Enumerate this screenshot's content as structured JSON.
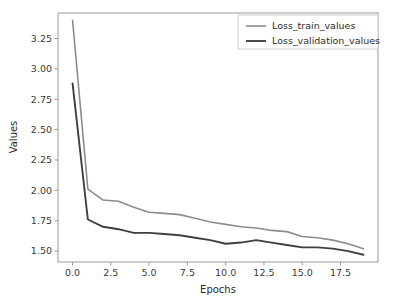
{
  "chart_data": {
    "type": "line",
    "title": "",
    "xlabel": "Epochs",
    "ylabel": "Values",
    "xlim": [
      -0.95,
      19.95
    ],
    "ylim": [
      1.41,
      3.46
    ],
    "grid": false,
    "legend_position": "upper right",
    "xticks": [
      0.0,
      2.5,
      5.0,
      7.5,
      10.0,
      12.5,
      15.0,
      17.5
    ],
    "xtick_labels": [
      "0.0",
      "2.5",
      "5.0",
      "7.5",
      "10.0",
      "12.5",
      "15.0",
      "17.5"
    ],
    "yticks": [
      1.5,
      1.75,
      2.0,
      2.25,
      2.5,
      2.75,
      3.0,
      3.25
    ],
    "ytick_labels": [
      "1.50",
      "1.75",
      "2.00",
      "2.25",
      "2.50",
      "2.75",
      "3.00",
      "3.25"
    ],
    "x": [
      0,
      1,
      2,
      3,
      4,
      5,
      6,
      7,
      8,
      9,
      10,
      11,
      12,
      13,
      14,
      15,
      16,
      17,
      18,
      19
    ],
    "series": [
      {
        "name": "Loss_train_values",
        "color": "#8c8c8c",
        "width": 1.6,
        "values": [
          3.4,
          2.01,
          1.92,
          1.91,
          1.86,
          1.82,
          1.81,
          1.8,
          1.77,
          1.74,
          1.72,
          1.7,
          1.69,
          1.67,
          1.66,
          1.62,
          1.61,
          1.59,
          1.56,
          1.52
        ]
      },
      {
        "name": "Loss_validation_values",
        "color": "#3f3f3f",
        "width": 1.9,
        "values": [
          2.88,
          1.76,
          1.7,
          1.68,
          1.65,
          1.65,
          1.64,
          1.63,
          1.61,
          1.59,
          1.56,
          1.57,
          1.59,
          1.57,
          1.55,
          1.53,
          1.53,
          1.52,
          1.5,
          1.47
        ]
      }
    ]
  },
  "legend": {
    "entries": [
      {
        "label": "Loss_train_values"
      },
      {
        "label": "Loss_validation_values"
      }
    ]
  },
  "axes": {
    "x_title": "Epochs",
    "y_title": "Values"
  }
}
